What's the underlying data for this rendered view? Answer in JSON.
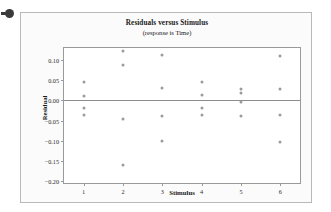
{
  "marker": {
    "icon": "bullet-dot-icon"
  },
  "chart_data": {
    "type": "scatter",
    "title": "Residuals versus Stimulus",
    "subtitle": "(response is Time)",
    "xlabel": "Stimulus",
    "ylabel": "Residual",
    "grid": false,
    "legend": null,
    "zero_reference_line": 0.0,
    "xlim": [
      0.5,
      6.5
    ],
    "ylim": [
      -0.205,
      0.13
    ],
    "xticks": [
      1,
      2,
      3,
      4,
      5,
      6
    ],
    "xticklabels": [
      "1",
      "2",
      "3",
      "4",
      "5",
      "6"
    ],
    "yticks": [
      0.1,
      0.05,
      0.0,
      -0.05,
      -0.1,
      -0.15,
      -0.2
    ],
    "yticklabels": [
      "0.10",
      "0.05",
      "0.00",
      "-0.05",
      "-0.10",
      "-0.15",
      "-0.20"
    ],
    "marker_color": "#9b9b9b",
    "categories": [
      1,
      2,
      3,
      4,
      5,
      6
    ],
    "points": [
      {
        "x": 1,
        "y": 0.046
      },
      {
        "x": 1,
        "y": 0.012
      },
      {
        "x": 1,
        "y": -0.02
      },
      {
        "x": 1,
        "y": -0.037
      },
      {
        "x": 2,
        "y": 0.122
      },
      {
        "x": 2,
        "y": 0.088
      },
      {
        "x": 2,
        "y": -0.045
      },
      {
        "x": 2,
        "y": -0.16
      },
      {
        "x": 3,
        "y": 0.112
      },
      {
        "x": 3,
        "y": 0.03
      },
      {
        "x": 3,
        "y": -0.038
      },
      {
        "x": 3,
        "y": -0.101
      },
      {
        "x": 4,
        "y": 0.046
      },
      {
        "x": 4,
        "y": 0.013
      },
      {
        "x": 4,
        "y": -0.02
      },
      {
        "x": 4,
        "y": -0.037
      },
      {
        "x": 5,
        "y": 0.029
      },
      {
        "x": 5,
        "y": 0.019
      },
      {
        "x": 5,
        "y": -0.004
      },
      {
        "x": 5,
        "y": -0.038
      },
      {
        "x": 6,
        "y": 0.111
      },
      {
        "x": 6,
        "y": 0.029
      },
      {
        "x": 6,
        "y": -0.037
      },
      {
        "x": 6,
        "y": -0.103
      }
    ],
    "series": [
      {
        "name": "Residual",
        "x": [
          1,
          1,
          1,
          1,
          2,
          2,
          2,
          2,
          3,
          3,
          3,
          3,
          4,
          4,
          4,
          4,
          5,
          5,
          5,
          5,
          6,
          6,
          6,
          6
        ],
        "values": [
          0.046,
          0.012,
          -0.02,
          -0.037,
          0.122,
          0.088,
          -0.045,
          -0.16,
          0.112,
          0.03,
          -0.038,
          -0.101,
          0.046,
          0.013,
          -0.02,
          -0.037,
          0.029,
          0.019,
          -0.004,
          -0.038,
          0.111,
          0.029,
          -0.037,
          -0.103
        ]
      }
    ]
  }
}
